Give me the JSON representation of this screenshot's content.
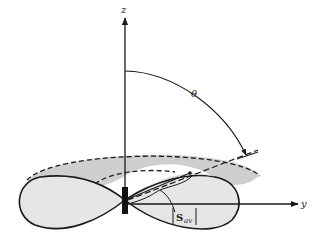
{
  "diagram": {
    "labels": {
      "z_axis": "z",
      "y_axis": "y",
      "angle": "θ",
      "poynting_main": "S",
      "poynting_sub": "av"
    },
    "colors": {
      "stroke": "#1a1a1a",
      "lobe_fill": "#e6e6e6",
      "top_fill": "#cfcfcf",
      "antenna": "#111111"
    }
  }
}
